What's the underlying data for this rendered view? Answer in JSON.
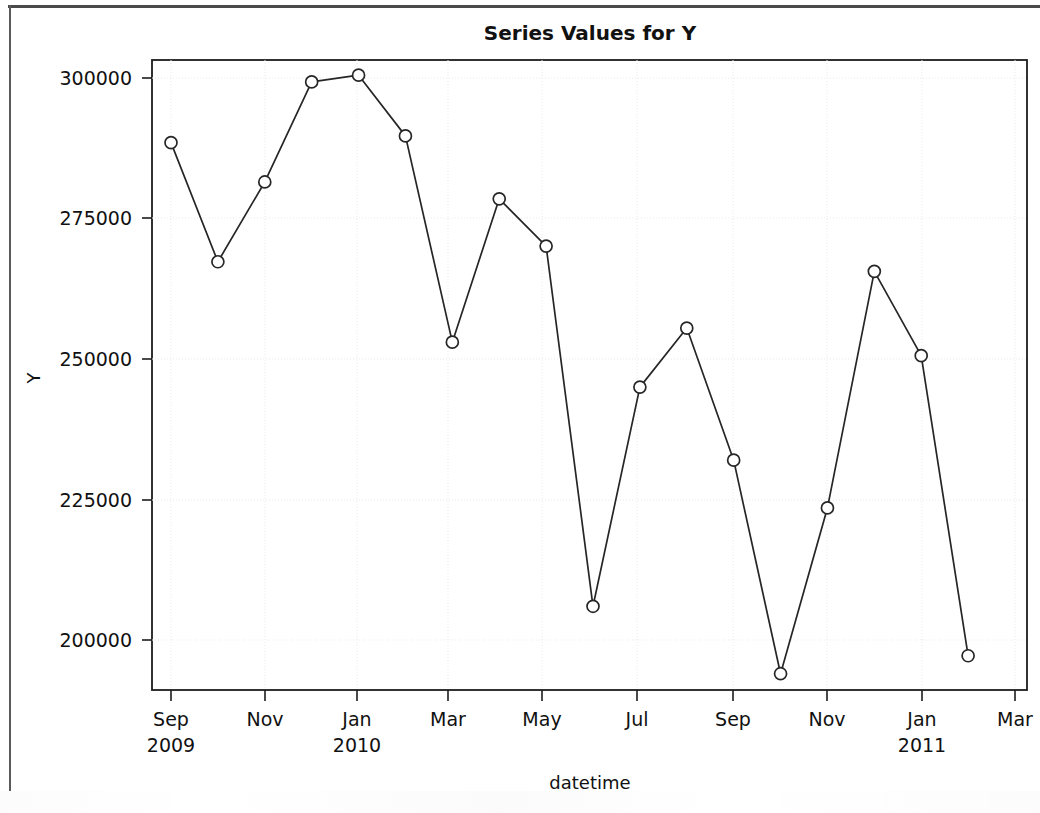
{
  "chart_data": {
    "type": "line",
    "title": "Series Values for Y",
    "xlabel": "datetime",
    "ylabel": "Y",
    "grid": true,
    "legend": null,
    "marker": "open-circle",
    "x": [
      "2009-09",
      "2009-10",
      "2009-11",
      "2009-12",
      "2010-01",
      "2010-02",
      "2010-03",
      "2010-04",
      "2010-05",
      "2010-06",
      "2010-07",
      "2010-08",
      "2010-09",
      "2010-10",
      "2010-11",
      "2010-12",
      "2011-01",
      "2011-02"
    ],
    "values": [
      288500,
      267300,
      281500,
      299300,
      300500,
      289700,
      253000,
      278500,
      270100,
      206000,
      245000,
      255500,
      232000,
      194000,
      223500,
      265600,
      250600,
      197200
    ],
    "ylim": [
      190000,
      303000
    ],
    "yticks": [
      200000,
      225000,
      250000,
      275000,
      300000
    ],
    "ytick_labels": [
      "200000",
      "225000",
      "250000",
      "275000",
      "300000"
    ],
    "xticks": [
      "2009-09",
      "2009-11",
      "2010-01",
      "2010-03",
      "2010-05",
      "2010-07",
      "2010-09",
      "2010-11",
      "2011-01",
      "2011-03"
    ],
    "xtick_labels": [
      {
        "month": "Sep",
        "year": "2009"
      },
      {
        "month": "Nov",
        "year": ""
      },
      {
        "month": "Jan",
        "year": "2010"
      },
      {
        "month": "Mar",
        "year": ""
      },
      {
        "month": "May",
        "year": ""
      },
      {
        "month": "Jul",
        "year": ""
      },
      {
        "month": "Sep",
        "year": ""
      },
      {
        "month": "Nov",
        "year": ""
      },
      {
        "month": "Jan",
        "year": "2011"
      },
      {
        "month": "Mar",
        "year": ""
      }
    ],
    "colors": {
      "line": "#262626",
      "marker_fill": "#ffffff",
      "marker_stroke": "#262626",
      "grid": "#e9e9ee",
      "axis": "#1c1c1c",
      "background": "#ffffff"
    }
  },
  "tick_labels": {
    "y": {
      "t300000": "300000",
      "t275000": "275000",
      "t250000": "250000",
      "t225000": "225000",
      "t200000": "200000"
    },
    "x": {
      "m1": "Sep",
      "y1": "2009",
      "m2": "Nov",
      "m3": "Jan",
      "y3": "2010",
      "m4": "Mar",
      "m5": "May",
      "m6": "Jul",
      "m7": "Sep",
      "m8": "Nov",
      "m9": "Jan",
      "y9": "2011",
      "m10": "Mar"
    }
  },
  "labels": {
    "title": "Series Values for Y",
    "xaxis": "datetime",
    "yaxis": "Y"
  }
}
